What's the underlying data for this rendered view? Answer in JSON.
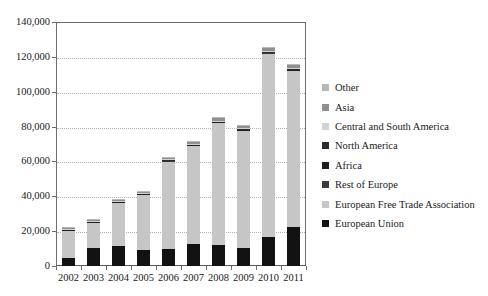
{
  "chart_data": {
    "type": "bar",
    "stacked": true,
    "title": "",
    "xlabel": "",
    "ylabel": "",
    "categories": [
      "2002",
      "2003",
      "2004",
      "2005",
      "2006",
      "2007",
      "2008",
      "2009",
      "2010",
      "2011"
    ],
    "ylim": [
      0,
      140000
    ],
    "ytick_values": [
      0,
      20000,
      40000,
      60000,
      80000,
      100000,
      120000,
      140000
    ],
    "ytick_labels": [
      "0",
      "20,000",
      "40,000",
      "60,000",
      "80,000",
      "100,000",
      "120,000",
      "140,000"
    ],
    "grid": true,
    "legend_position": "right",
    "series": [
      {
        "name": "European Union",
        "color": "#121212",
        "values": [
          4800,
          10300,
          11700,
          9300,
          9500,
          12400,
          12100,
          10400,
          16600,
          22300
        ]
      },
      {
        "name": "European Free Trade Association",
        "color": "#c6c6c6",
        "values": [
          15700,
          14700,
          24600,
          31600,
          50500,
          56700,
          70000,
          67200,
          105200,
          89600
        ]
      },
      {
        "name": "Rest of Europe",
        "color": "#3a3a3a",
        "values": [
          250,
          250,
          300,
          300,
          350,
          350,
          400,
          400,
          450,
          450
        ]
      },
      {
        "name": "Africa",
        "color": "#1e1e1e",
        "values": [
          150,
          150,
          200,
          200,
          250,
          250,
          300,
          300,
          350,
          350
        ]
      },
      {
        "name": "North America",
        "color": "#2c2c2c",
        "values": [
          200,
          200,
          250,
          250,
          300,
          300,
          350,
          350,
          400,
          400
        ]
      },
      {
        "name": "Central and South America",
        "color": "#d2d2d2",
        "values": [
          150,
          150,
          200,
          200,
          250,
          250,
          300,
          300,
          350,
          350
        ]
      },
      {
        "name": "Asia",
        "color": "#8f8f8f",
        "values": [
          700,
          900,
          1000,
          1000,
          1200,
          1200,
          1400,
          1300,
          1600,
          1700
        ]
      },
      {
        "name": "Other",
        "color": "#b8b8b8",
        "values": [
          250,
          350,
          350,
          400,
          450,
          450,
          500,
          450,
          550,
          600
        ]
      }
    ],
    "totals": [
      22200,
      27000,
      38600,
      43250,
      62800,
      71700,
      85350,
      80700,
      125500,
      115750
    ],
    "legend_order": [
      "Other",
      "Asia",
      "Central and South America",
      "North America",
      "Africa",
      "Rest of Europe",
      "European Free Trade Association",
      "European Union"
    ]
  }
}
